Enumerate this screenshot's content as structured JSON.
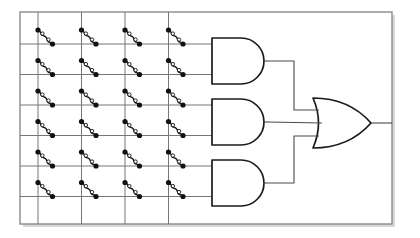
{
  "figure": {
    "canvas": {
      "width": 420,
      "height": 238
    },
    "background_color": "#ffffff",
    "frame": {
      "x": 20,
      "y": 12,
      "width": 372,
      "height": 212,
      "stroke_color": "#8a8a8a",
      "stroke_width": 1.4,
      "fill_color": "#ffffff",
      "shadow_color": "#b8b8b8",
      "shadow_offset": 3
    },
    "crossbar": {
      "label": "crossbar-array",
      "columns": 4,
      "rows": 6,
      "column_x": [
        38,
        81.5,
        125,
        168.5
      ],
      "row_y": [
        30,
        60.5,
        91,
        121.5,
        152,
        182.5
      ],
      "row_line_y": [
        44,
        74.5,
        105,
        135.5,
        166,
        196.5
      ],
      "col_line_top": 12,
      "col_line_bottom": 224,
      "row_line_x_start": 20,
      "row_line_x_end_default": 212,
      "wire_color": "#767676",
      "wire_width": 1.0,
      "cell_count": 24
    },
    "cell": {
      "label": "memristor-cell",
      "symbol": "serpentine-memristor",
      "terminal_dot_radius": 2.6,
      "terminal_dot_color": "#111111",
      "open_node_radius": 1.7,
      "open_node_fill": "#ffffff",
      "squiggle_color": "#111111",
      "squiggle_width": 1.35,
      "span_x": 14.5,
      "span_y": 14.0
    },
    "and_gates": [
      {
        "name": "and-gate-1",
        "label": "AND",
        "x": 212,
        "y": 38,
        "width": 52,
        "height": 46,
        "inputs": 2,
        "input_rows": [
          1,
          2
        ],
        "out_x": 268,
        "out_y": 61
      },
      {
        "name": "and-gate-2",
        "label": "AND",
        "x": 212,
        "y": 99,
        "width": 52,
        "height": 46,
        "inputs": 2,
        "input_rows": [
          3,
          4
        ],
        "out_x": 268,
        "out_y": 122
      },
      {
        "name": "and-gate-3",
        "label": "AND",
        "x": 212,
        "y": 160,
        "width": 52,
        "height": 46,
        "inputs": 2,
        "input_rows": [
          5,
          6
        ],
        "out_x": 268,
        "out_y": 183
      }
    ],
    "or_gate": {
      "name": "or-gate",
      "label": "OR",
      "x": 313,
      "y": 98,
      "width": 58,
      "height": 50,
      "inputs": 3,
      "out_x": 371,
      "out_y": 123
    },
    "interconnect": {
      "label": "gate-interconnect",
      "bus_x": 294,
      "top_branch_y": 61,
      "middle_branch_y": 122,
      "bottom_branch_y": 183,
      "or_input_y": [
        110,
        123,
        136
      ],
      "output_wire_end_x": 392
    },
    "gate_style": {
      "stroke_color": "#1a1a1a",
      "stroke_width": 1.7,
      "fill_color": "#ffffff",
      "lead_color": "#4a4a4a",
      "lead_width": 1.1
    }
  }
}
